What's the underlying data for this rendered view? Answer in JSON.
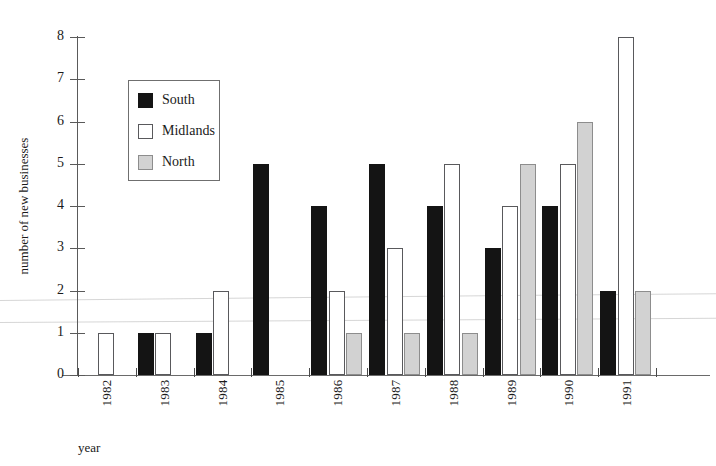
{
  "chart_data": {
    "type": "bar",
    "title": "",
    "subtitle": "",
    "xlabel": "year",
    "ylabel": "number of new businesses",
    "categories": [
      "1982",
      "1983",
      "1984",
      "1985",
      "1986",
      "1987",
      "1988",
      "1989",
      "1990",
      "1991"
    ],
    "series": [
      {
        "name": "South",
        "color": "#141414",
        "values": [
          0,
          1,
          1,
          5,
          4,
          5,
          4,
          3,
          4,
          2
        ]
      },
      {
        "name": "Midlands",
        "color": "#ffffff",
        "values": [
          1,
          1,
          2,
          0,
          2,
          3,
          5,
          4,
          5,
          8
        ]
      },
      {
        "name": "North",
        "color": "#d2d2d2",
        "values": [
          0,
          0,
          0,
          0,
          1,
          1,
          1,
          5,
          6,
          2
        ]
      }
    ],
    "ylim": [
      0,
      8
    ],
    "y_ticks": [
      0,
      1,
      2,
      3,
      4,
      5,
      6,
      7,
      8
    ],
    "y_tick_labels": [
      "0",
      "1",
      "2",
      "3",
      "4",
      "5",
      "6",
      "7",
      "8"
    ],
    "grid": false,
    "legend_position": "upper-left-inside",
    "bar_mode": "grouped"
  },
  "legend": {
    "entries": [
      {
        "label": "South",
        "swatch": "south"
      },
      {
        "label": "Midlands",
        "swatch": "midlands"
      },
      {
        "label": "North",
        "swatch": "north"
      }
    ]
  },
  "axes": {
    "x_title": "year",
    "y_title": "number of new businesses"
  }
}
